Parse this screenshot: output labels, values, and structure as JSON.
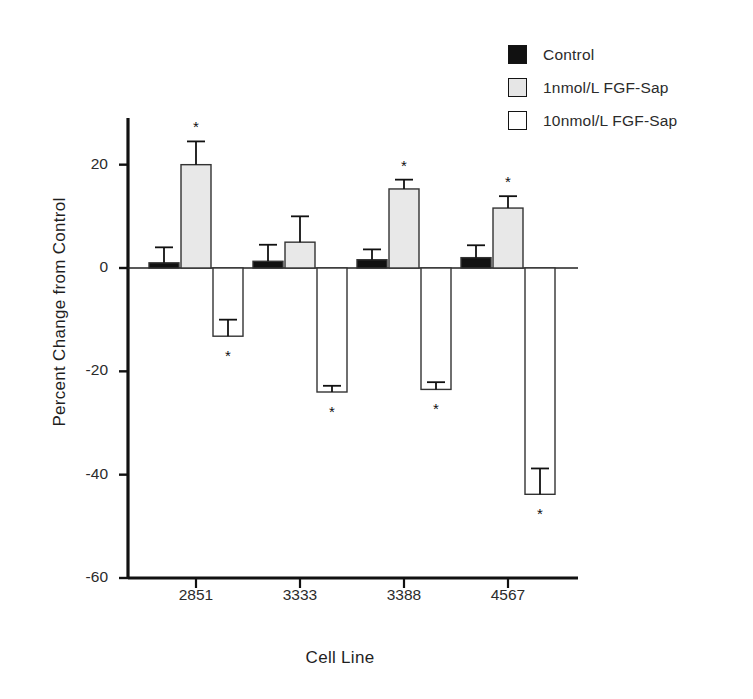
{
  "chart_data": {
    "type": "bar",
    "title": "",
    "xlabel": "Cell Line",
    "ylabel": "Percent Change from Control",
    "categories": [
      "2851",
      "3333",
      "3388",
      "4567"
    ],
    "ylim": [
      -60,
      28
    ],
    "yticks": [
      20,
      0,
      -20,
      -40,
      -60
    ],
    "ytick_labels": [
      "20",
      "0",
      "-20",
      "-40",
      "-60"
    ],
    "grid": false,
    "legend_position": "top-right",
    "series": [
      {
        "name": "Control",
        "color": "#111111",
        "fill": "solid-black",
        "values": [
          1.0,
          1.3,
          1.6,
          2.0
        ],
        "errors": [
          3.0,
          3.2,
          2.0,
          2.4
        ],
        "significance": [
          "",
          "",
          "",
          ""
        ]
      },
      {
        "name": "1nmol/L FGF-Sap",
        "color": "#e6e6e6",
        "fill": "light-gray",
        "values": [
          20.0,
          5.0,
          15.3,
          11.6
        ],
        "errors": [
          4.5,
          5.0,
          1.8,
          2.3
        ],
        "significance": [
          "*",
          "",
          "*",
          "*"
        ]
      },
      {
        "name": "10nmol/L FGF-Sap",
        "color": "#ffffff",
        "fill": "white",
        "values": [
          -13.2,
          -24.0,
          -23.5,
          -43.8
        ],
        "errors": [
          3.2,
          1.2,
          1.4,
          5.0
        ],
        "significance": [
          "*",
          "*",
          "*",
          "*"
        ]
      }
    ],
    "annotations": [
      {
        "text": "*",
        "series": "1nmol/L FGF-Sap",
        "category": "2851"
      },
      {
        "text": "*",
        "series": "1nmol/L FGF-Sap",
        "category": "3388"
      },
      {
        "text": "*",
        "series": "1nmol/L FGF-Sap",
        "category": "4567"
      },
      {
        "text": "*",
        "series": "10nmol/L FGF-Sap",
        "category": "2851"
      },
      {
        "text": "*",
        "series": "10nmol/L FGF-Sap",
        "category": "3333"
      },
      {
        "text": "*",
        "series": "10nmol/L FGF-Sap",
        "category": "3388"
      },
      {
        "text": "*",
        "series": "10nmol/L FGF-Sap",
        "category": "4567"
      }
    ]
  },
  "legend": {
    "items": [
      {
        "label": "Control",
        "swatch": "black"
      },
      {
        "label": "1nmol/L FGF-Sap",
        "swatch": "lightgray"
      },
      {
        "label": "10nmol/L FGF-Sap",
        "swatch": "white"
      }
    ]
  },
  "axes": {
    "y_title": "Percent Change from Control",
    "x_title": "Cell Line",
    "y_tick_labels": [
      "20",
      "0",
      "-20",
      "-40",
      "-60"
    ],
    "x_tick_labels": [
      "2851",
      "3333",
      "3388",
      "4567"
    ]
  }
}
